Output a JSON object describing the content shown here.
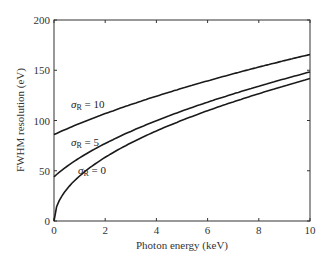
{
  "chart_data": {
    "type": "line",
    "title": "",
    "xlabel": "Photon energy  (keV)",
    "ylabel": "FWHM resolution  (eV)",
    "xlim": [
      0,
      10
    ],
    "ylim": [
      0,
      200
    ],
    "xticks": [
      "0",
      "2",
      "4",
      "6",
      "8",
      "10"
    ],
    "yticks": [
      "0",
      "50",
      "100",
      "150",
      "200"
    ],
    "grid": false,
    "legend": "none (inline annotations)",
    "x": [
      0,
      0.25,
      0.5,
      1,
      2,
      3,
      4,
      5,
      6,
      7,
      8,
      9,
      10
    ],
    "series": [
      {
        "name": "σR = 10",
        "label_sigma": "σ",
        "label_sub": "R",
        "label_value": "= 10",
        "values": [
          86,
          88,
          90,
          94,
          102,
          110,
          118,
          126,
          133,
          140,
          147,
          153,
          166
        ]
      },
      {
        "name": "σR = 5",
        "label_sigma": "σ",
        "label_sub": "R",
        "label_value": "= 5",
        "values": [
          44,
          47,
          51,
          57,
          69,
          81,
          92,
          103,
          113,
          122,
          131,
          140,
          149
        ]
      },
      {
        "name": "σR = 0",
        "label_sigma": "σ",
        "label_sub": "R",
        "label_value": "= 0",
        "values": [
          0,
          13,
          19,
          27,
          45,
          60,
          73,
          85,
          96,
          107,
          117,
          127,
          142
        ]
      }
    ]
  }
}
